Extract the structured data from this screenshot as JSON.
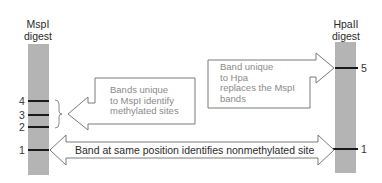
{
  "diagram": {
    "type": "gel-electrophoresis-comparison",
    "colors": {
      "gel_lane": "#b4b4b4",
      "band": "#1a1a1a",
      "arrow_outline": "#7a7a7a",
      "note_text": "#8a8a8a",
      "label_text": "#2a2a2a"
    },
    "lanes": [
      {
        "id": "mspi",
        "title_line1": "MspI",
        "title_line2": "digest",
        "bands": [
          {
            "label": "4"
          },
          {
            "label": "3"
          },
          {
            "label": "2"
          },
          {
            "label": "1"
          }
        ]
      },
      {
        "id": "hpaii",
        "title_line1": "HpaII",
        "title_line2": "digest",
        "bands": [
          {
            "label": "5"
          },
          {
            "label": "1"
          }
        ]
      }
    ],
    "callouts": {
      "mspi_unique": {
        "line1": "Bands unique",
        "line2": "to MspI identify",
        "line3": "methylated sites"
      },
      "hpa_unique": {
        "line1": "Band unique",
        "line2": "to Hpa",
        "line3": "replaces the MspI",
        "line4": "bands"
      },
      "shared": {
        "text": "Band at same position identifies nonmethylated site"
      }
    }
  }
}
